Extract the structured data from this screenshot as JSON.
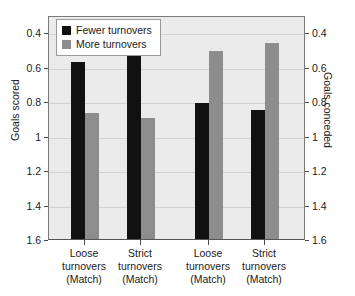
{
  "title": "",
  "legend": {
    "position": "top-left",
    "items": [
      {
        "label": "Fewer turnovers",
        "color": "#111111",
        "key": "fewer"
      },
      {
        "label": "More turnovers",
        "color": "#8d8d8d",
        "key": "more"
      }
    ]
  },
  "axes": {
    "left": {
      "title": "Goals scored",
      "ticks": [
        "1.6",
        "1.4",
        "1.2",
        "1",
        "0.8",
        "0.6",
        "0.4"
      ],
      "min": 0.4,
      "max": 1.7
    },
    "right": {
      "title": "Goals conceded",
      "ticks": [
        "1.6",
        "1.4",
        "1.2",
        "1",
        "0.8",
        "0.6",
        "0.4"
      ],
      "min": 0.4,
      "max": 1.7
    }
  },
  "categories": [
    {
      "line1": "Loose",
      "line2": "turnovers",
      "line3": "(Match)"
    },
    {
      "line1": "Strict",
      "line2": "turnovers",
      "line3": "(Match)"
    },
    {
      "line1": "Loose",
      "line2": "turnovers",
      "line3": "(Match)"
    },
    {
      "line1": "Strict",
      "line2": "turnovers",
      "line3": "(Match)"
    }
  ],
  "chart_data": {
    "type": "bar",
    "title": "",
    "xlabel": "",
    "ylabel": "Goals scored",
    "ylabel_secondary": "Goals conceded",
    "ylim": [
      0.4,
      1.7
    ],
    "yticks": [
      0.4,
      0.6,
      0.8,
      1.0,
      1.2,
      1.4,
      1.6
    ],
    "grid": true,
    "legend_position": "top-left",
    "categories": [
      "Loose turnovers (Match)",
      "Strict turnovers (Match)",
      "Loose turnovers (Match)",
      "Strict turnovers (Match)"
    ],
    "series": [
      {
        "name": "Fewer turnovers",
        "color": "#111111",
        "values": [
          1.43,
          1.47,
          1.19,
          1.15
        ]
      },
      {
        "name": "More turnovers",
        "color": "#8d8d8d",
        "values": [
          1.13,
          1.1,
          1.49,
          1.54
        ]
      }
    ]
  }
}
